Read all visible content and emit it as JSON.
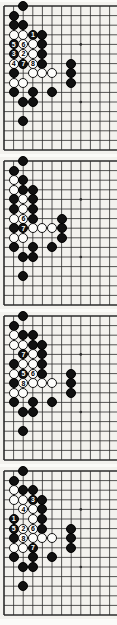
{
  "page": {
    "width": 117,
    "height": 625,
    "background": "#fbfbf8",
    "board_color": "#f3f2ee",
    "line_color": "#2b2b2b",
    "black_color": "#111111",
    "white_color": "#fdfdfb",
    "caption": ""
  },
  "board": {
    "cell": 9.6,
    "origin_x": 4.0,
    "origin_y": 4.0,
    "cols": 12,
    "rows": 15,
    "star_points": [
      [
        8,
        4
      ],
      [
        8,
        10
      ]
    ]
  },
  "diagrams": [
    {
      "id": "diagram-1",
      "name": "figure-1",
      "top": 2,
      "height": 152,
      "label": "Figure 1",
      "moves": [
        "1",
        "2",
        "3",
        "4",
        "5",
        "6",
        "7",
        "8"
      ],
      "stones": [
        {
          "col": 2,
          "row": 0,
          "color": "black",
          "label": ""
        },
        {
          "col": 1,
          "row": 1,
          "color": "black",
          "label": ""
        },
        {
          "col": 1,
          "row": 2,
          "color": "black",
          "label": ""
        },
        {
          "col": 2,
          "row": 2,
          "color": "black",
          "label": ""
        },
        {
          "col": 1,
          "row": 3,
          "color": "white",
          "label": ""
        },
        {
          "col": 2,
          "row": 3,
          "color": "white",
          "label": ""
        },
        {
          "col": 3,
          "row": 3,
          "color": "black",
          "label": "1"
        },
        {
          "col": 4,
          "row": 3,
          "color": "black",
          "label": ""
        },
        {
          "col": 1,
          "row": 4,
          "color": "black",
          "label": "5"
        },
        {
          "col": 2,
          "row": 4,
          "color": "white",
          "label": "6"
        },
        {
          "col": 3,
          "row": 4,
          "color": "white",
          "label": ""
        },
        {
          "col": 4,
          "row": 4,
          "color": "black",
          "label": ""
        },
        {
          "col": 1,
          "row": 5,
          "color": "black",
          "label": "3"
        },
        {
          "col": 2,
          "row": 5,
          "color": "white",
          "label": "2"
        },
        {
          "col": 3,
          "row": 5,
          "color": "white",
          "label": ""
        },
        {
          "col": 4,
          "row": 5,
          "color": "black",
          "label": ""
        },
        {
          "col": 1,
          "row": 6,
          "color": "white",
          "label": "4"
        },
        {
          "col": 2,
          "row": 6,
          "color": "black",
          "label": "7"
        },
        {
          "col": 3,
          "row": 6,
          "color": "white",
          "label": "8"
        },
        {
          "col": 4,
          "row": 6,
          "color": "black",
          "label": ""
        },
        {
          "col": 7,
          "row": 6,
          "color": "black",
          "label": ""
        },
        {
          "col": 1,
          "row": 7,
          "color": "black",
          "label": ""
        },
        {
          "col": 3,
          "row": 7,
          "color": "white",
          "label": ""
        },
        {
          "col": 4,
          "row": 7,
          "color": "white",
          "label": ""
        },
        {
          "col": 5,
          "row": 7,
          "color": "white",
          "label": ""
        },
        {
          "col": 7,
          "row": 7,
          "color": "black",
          "label": ""
        },
        {
          "col": 1,
          "row": 8,
          "color": "white",
          "label": ""
        },
        {
          "col": 2,
          "row": 8,
          "color": "white",
          "label": ""
        },
        {
          "col": 7,
          "row": 8,
          "color": "black",
          "label": ""
        },
        {
          "col": 1,
          "row": 9,
          "color": "black",
          "label": ""
        },
        {
          "col": 3,
          "row": 9,
          "color": "black",
          "label": ""
        },
        {
          "col": 5,
          "row": 9,
          "color": "black",
          "label": ""
        },
        {
          "col": 2,
          "row": 10,
          "color": "black",
          "label": ""
        },
        {
          "col": 3,
          "row": 10,
          "color": "black",
          "label": ""
        },
        {
          "col": 2,
          "row": 12,
          "color": "black",
          "label": ""
        }
      ]
    },
    {
      "id": "diagram-2",
      "name": "figure-2",
      "top": 157,
      "height": 152,
      "label": "Figure 2",
      "moves": [
        "6",
        "7"
      ],
      "stones": [
        {
          "col": 2,
          "row": 0,
          "color": "black",
          "label": ""
        },
        {
          "col": 1,
          "row": 1,
          "color": "black",
          "label": ""
        },
        {
          "col": 1,
          "row": 2,
          "color": "white",
          "label": ""
        },
        {
          "col": 2,
          "row": 2,
          "color": "black",
          "label": ""
        },
        {
          "col": 1,
          "row": 3,
          "color": "white",
          "label": ""
        },
        {
          "col": 2,
          "row": 3,
          "color": "black",
          "label": ""
        },
        {
          "col": 3,
          "row": 3,
          "color": "black",
          "label": ""
        },
        {
          "col": 1,
          "row": 4,
          "color": "black",
          "label": ""
        },
        {
          "col": 2,
          "row": 4,
          "color": "white",
          "label": ""
        },
        {
          "col": 3,
          "row": 4,
          "color": "black",
          "label": ""
        },
        {
          "col": 1,
          "row": 5,
          "color": "black",
          "label": ""
        },
        {
          "col": 2,
          "row": 5,
          "color": "white",
          "label": ""
        },
        {
          "col": 3,
          "row": 5,
          "color": "black",
          "label": ""
        },
        {
          "col": 1,
          "row": 6,
          "color": "white",
          "label": ""
        },
        {
          "col": 2,
          "row": 6,
          "color": "white",
          "label": "6"
        },
        {
          "col": 3,
          "row": 6,
          "color": "black",
          "label": ""
        },
        {
          "col": 6,
          "row": 6,
          "color": "black",
          "label": ""
        },
        {
          "col": 1,
          "row": 7,
          "color": "black",
          "label": ""
        },
        {
          "col": 2,
          "row": 7,
          "color": "black",
          "label": "7"
        },
        {
          "col": 3,
          "row": 7,
          "color": "white",
          "label": ""
        },
        {
          "col": 4,
          "row": 7,
          "color": "white",
          "label": ""
        },
        {
          "col": 5,
          "row": 7,
          "color": "white",
          "label": ""
        },
        {
          "col": 6,
          "row": 7,
          "color": "black",
          "label": ""
        },
        {
          "col": 1,
          "row": 8,
          "color": "white",
          "label": ""
        },
        {
          "col": 2,
          "row": 8,
          "color": "white",
          "label": ""
        },
        {
          "col": 6,
          "row": 8,
          "color": "black",
          "label": ""
        },
        {
          "col": 1,
          "row": 9,
          "color": "black",
          "label": ""
        },
        {
          "col": 3,
          "row": 9,
          "color": "black",
          "label": ""
        },
        {
          "col": 5,
          "row": 9,
          "color": "black",
          "label": ""
        },
        {
          "col": 2,
          "row": 10,
          "color": "black",
          "label": ""
        },
        {
          "col": 3,
          "row": 10,
          "color": "black",
          "label": ""
        },
        {
          "col": 2,
          "row": 12,
          "color": "black",
          "label": ""
        }
      ]
    },
    {
      "id": "diagram-3",
      "name": "figure-3",
      "top": 312,
      "height": 152,
      "label": "Figure 3",
      "moves": [
        "5",
        "6",
        "7",
        "8"
      ],
      "stones": [
        {
          "col": 2,
          "row": 0,
          "color": "black",
          "label": ""
        },
        {
          "col": 1,
          "row": 1,
          "color": "black",
          "label": ""
        },
        {
          "col": 1,
          "row": 2,
          "color": "white",
          "label": ""
        },
        {
          "col": 2,
          "row": 2,
          "color": "black",
          "label": ""
        },
        {
          "col": 3,
          "row": 2,
          "color": "black",
          "label": ""
        },
        {
          "col": 1,
          "row": 3,
          "color": "white",
          "label": ""
        },
        {
          "col": 2,
          "row": 3,
          "color": "white",
          "label": ""
        },
        {
          "col": 3,
          "row": 3,
          "color": "black",
          "label": ""
        },
        {
          "col": 4,
          "row": 3,
          "color": "black",
          "label": ""
        },
        {
          "col": 2,
          "row": 4,
          "color": "black",
          "label": "7"
        },
        {
          "col": 3,
          "row": 4,
          "color": "white",
          "label": ""
        },
        {
          "col": 4,
          "row": 4,
          "color": "black",
          "label": ""
        },
        {
          "col": 1,
          "row": 5,
          "color": "black",
          "label": ""
        },
        {
          "col": 2,
          "row": 5,
          "color": "white",
          "label": ""
        },
        {
          "col": 3,
          "row": 5,
          "color": "white",
          "label": ""
        },
        {
          "col": 4,
          "row": 5,
          "color": "black",
          "label": ""
        },
        {
          "col": 1,
          "row": 6,
          "color": "white",
          "label": ""
        },
        {
          "col": 2,
          "row": 6,
          "color": "black",
          "label": "5"
        },
        {
          "col": 3,
          "row": 6,
          "color": "white",
          "label": "6"
        },
        {
          "col": 4,
          "row": 6,
          "color": "black",
          "label": ""
        },
        {
          "col": 7,
          "row": 6,
          "color": "black",
          "label": ""
        },
        {
          "col": 1,
          "row": 7,
          "color": "black",
          "label": ""
        },
        {
          "col": 2,
          "row": 7,
          "color": "white",
          "label": "8"
        },
        {
          "col": 3,
          "row": 7,
          "color": "white",
          "label": ""
        },
        {
          "col": 4,
          "row": 7,
          "color": "white",
          "label": ""
        },
        {
          "col": 5,
          "row": 7,
          "color": "white",
          "label": ""
        },
        {
          "col": 7,
          "row": 7,
          "color": "black",
          "label": ""
        },
        {
          "col": 1,
          "row": 8,
          "color": "white",
          "label": ""
        },
        {
          "col": 2,
          "row": 8,
          "color": "white",
          "label": ""
        },
        {
          "col": 7,
          "row": 8,
          "color": "black",
          "label": ""
        },
        {
          "col": 1,
          "row": 9,
          "color": "black",
          "label": ""
        },
        {
          "col": 3,
          "row": 9,
          "color": "black",
          "label": ""
        },
        {
          "col": 5,
          "row": 9,
          "color": "black",
          "label": ""
        },
        {
          "col": 2,
          "row": 10,
          "color": "black",
          "label": ""
        },
        {
          "col": 3,
          "row": 10,
          "color": "black",
          "label": ""
        },
        {
          "col": 2,
          "row": 12,
          "color": "black",
          "label": ""
        }
      ]
    },
    {
      "id": "diagram-4",
      "name": "figure-4",
      "top": 467,
      "height": 152,
      "label": "Figure 4",
      "moves": [
        "1",
        "2",
        "3",
        "4",
        "5",
        "6",
        "7",
        "8"
      ],
      "stones": [
        {
          "col": 2,
          "row": 0,
          "color": "black",
          "label": ""
        },
        {
          "col": 1,
          "row": 1,
          "color": "black",
          "label": ""
        },
        {
          "col": 1,
          "row": 2,
          "color": "white",
          "label": ""
        },
        {
          "col": 2,
          "row": 2,
          "color": "black",
          "label": ""
        },
        {
          "col": 3,
          "row": 2,
          "color": "black",
          "label": ""
        },
        {
          "col": 1,
          "row": 3,
          "color": "white",
          "label": ""
        },
        {
          "col": 2,
          "row": 3,
          "color": "white",
          "label": ""
        },
        {
          "col": 3,
          "row": 3,
          "color": "black",
          "label": "3"
        },
        {
          "col": 4,
          "row": 3,
          "color": "black",
          "label": ""
        },
        {
          "col": 2,
          "row": 4,
          "color": "white",
          "label": "4"
        },
        {
          "col": 3,
          "row": 4,
          "color": "white",
          "label": ""
        },
        {
          "col": 4,
          "row": 4,
          "color": "black",
          "label": ""
        },
        {
          "col": 1,
          "row": 5,
          "color": "black",
          "label": "1"
        },
        {
          "col": 3,
          "row": 5,
          "color": "white",
          "label": ""
        },
        {
          "col": 4,
          "row": 5,
          "color": "black",
          "label": ""
        },
        {
          "col": 1,
          "row": 6,
          "color": "black",
          "label": "5"
        },
        {
          "col": 2,
          "row": 6,
          "color": "white",
          "label": "2"
        },
        {
          "col": 3,
          "row": 6,
          "color": "white",
          "label": "6"
        },
        {
          "col": 4,
          "row": 6,
          "color": "black",
          "label": ""
        },
        {
          "col": 7,
          "row": 6,
          "color": "black",
          "label": ""
        },
        {
          "col": 1,
          "row": 7,
          "color": "black",
          "label": ""
        },
        {
          "col": 2,
          "row": 7,
          "color": "white",
          "label": "8"
        },
        {
          "col": 3,
          "row": 7,
          "color": "white",
          "label": ""
        },
        {
          "col": 4,
          "row": 7,
          "color": "white",
          "label": ""
        },
        {
          "col": 5,
          "row": 7,
          "color": "white",
          "label": ""
        },
        {
          "col": 7,
          "row": 7,
          "color": "black",
          "label": ""
        },
        {
          "col": 1,
          "row": 8,
          "color": "white",
          "label": ""
        },
        {
          "col": 2,
          "row": 8,
          "color": "white",
          "label": ""
        },
        {
          "col": 3,
          "row": 8,
          "color": "black",
          "label": "7"
        },
        {
          "col": 7,
          "row": 8,
          "color": "black",
          "label": ""
        },
        {
          "col": 1,
          "row": 9,
          "color": "black",
          "label": ""
        },
        {
          "col": 3,
          "row": 9,
          "color": "black",
          "label": ""
        },
        {
          "col": 5,
          "row": 9,
          "color": "black",
          "label": ""
        },
        {
          "col": 2,
          "row": 10,
          "color": "black",
          "label": ""
        },
        {
          "col": 3,
          "row": 10,
          "color": "black",
          "label": ""
        },
        {
          "col": 2,
          "row": 12,
          "color": "black",
          "label": ""
        }
      ]
    }
  ]
}
